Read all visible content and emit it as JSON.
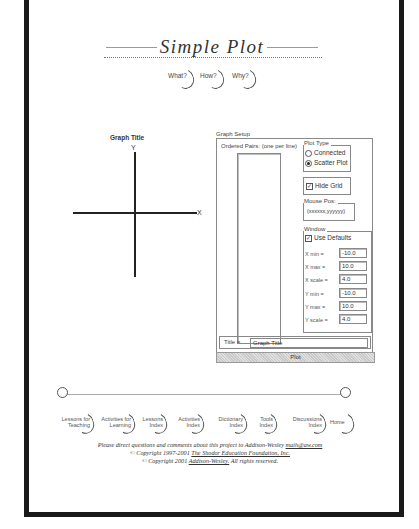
{
  "header": {
    "title": "Simple Plot",
    "question_buttons": [
      {
        "label": "What?"
      },
      {
        "label": "How?"
      },
      {
        "label": "Why?"
      }
    ]
  },
  "graph": {
    "title": "Graph Title",
    "x_label": "X",
    "y_label": "Y"
  },
  "setup": {
    "legend": "Graph Setup",
    "ordered_pairs_label": "Ordered Pairs: (one per line)",
    "ordered_pairs_value": "",
    "plot_type": {
      "legend": "Plot Type",
      "options": [
        {
          "label": "Connected",
          "selected": false
        },
        {
          "label": "Scatter Plot",
          "selected": true
        }
      ]
    },
    "hide_grid": {
      "label": "Hide Grid",
      "checked": true
    },
    "mouse_pos": {
      "legend": "Mouse Pos:",
      "value": "(xxxxxx,yyyyyy)"
    },
    "window": {
      "legend": "Window",
      "use_defaults": {
        "label": "Use Defaults",
        "checked": true
      },
      "fields": [
        {
          "label": "X min =",
          "value": "-10.0"
        },
        {
          "label": "X max =",
          "value": "10.0"
        },
        {
          "label": "X scale =",
          "value": "4.0"
        },
        {
          "label": "Y min =",
          "value": "-10.0"
        },
        {
          "label": "Y max =",
          "value": "10.0"
        },
        {
          "label": "Y scale =",
          "value": "4.0"
        }
      ]
    },
    "title_label": "Title =",
    "title_value": "Graph Title",
    "plot_button": "Plot"
  },
  "nav": {
    "items": [
      {
        "label": "Lessons for Teaching"
      },
      {
        "label": "Activities for Learning"
      },
      {
        "label": "Lessons Index"
      },
      {
        "label": "Activities Index"
      },
      {
        "label": "Dictionary Index"
      },
      {
        "label": "Tools Index"
      },
      {
        "label": "Discussions Index"
      },
      {
        "label": "Home"
      }
    ]
  },
  "footer": {
    "line1_text": "Please direct questions and comments about this project to Addison-Wesley",
    "line1_link": "math@aw.com",
    "line2_text": "© Copyright 1997-2001",
    "line2_link": "The Shodor Education Foundation, Inc.",
    "line3_text": "© Copyright 2001",
    "line3_link": "Addison-Wesley.",
    "line3_suffix": "All rights reserved."
  }
}
